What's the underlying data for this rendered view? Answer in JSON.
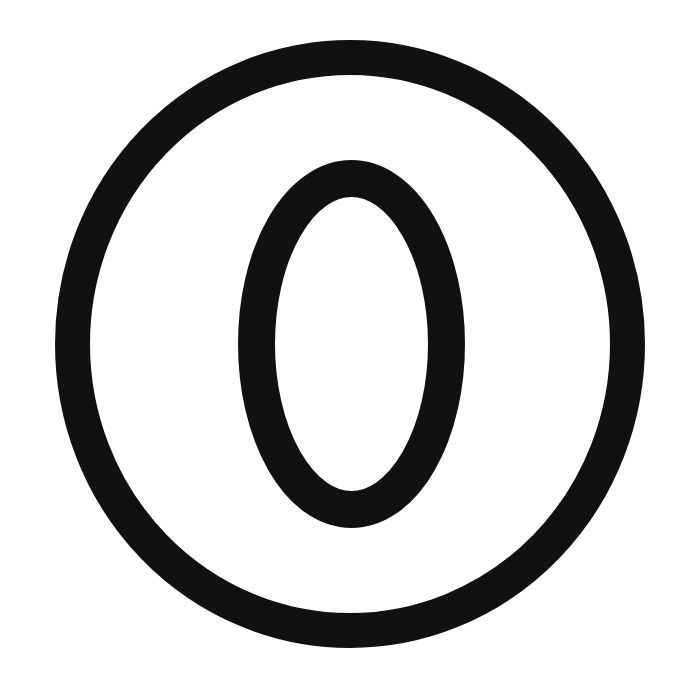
{
  "page": {
    "title": "Circled Zero Symbol",
    "width": 695,
    "height": 681,
    "background_color": "#ffffff"
  },
  "symbol": {
    "name": "circled-zero",
    "character": "⓪",
    "description": "A thick black outline circle enclosing a thick black vertical oval, forming a circled zero / circled letter O symbol.",
    "alt_text": "Circled zero symbol",
    "stroke_color": "#111111",
    "fill_color": "#ffffff"
  },
  "shapes": {
    "outer_ring": {
      "name": "outer-circle",
      "center_x": 350,
      "center_y": 344,
      "radius_x": 277.5,
      "radius_y": 286.5,
      "stroke_width": 35,
      "stroke_color": "#111111",
      "bbox_left": 55,
      "bbox_top": 40,
      "bbox_right": 645,
      "bbox_bottom": 648
    },
    "inner_oval": {
      "name": "inner-oval",
      "center_x": 351,
      "center_y": 344,
      "radius_x": 95,
      "radius_y": 165,
      "stroke_width": 37,
      "stroke_color": "#111111",
      "bbox_left": 238,
      "bbox_top": 160,
      "bbox_right": 465,
      "bbox_bottom": 528
    }
  }
}
